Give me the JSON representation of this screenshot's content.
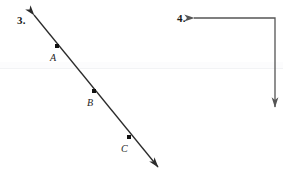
{
  "page": {
    "width": 283,
    "height": 178,
    "background": "#ffffff",
    "ink_color": "#2b2b2b",
    "label_color": "#1a1a1a"
  },
  "problems": [
    {
      "number": "3.",
      "type": "line-with-points",
      "description": "A straight line with arrowheads at both ends, sloping down to the right, with three labeled points on it",
      "line": {
        "x1": 34,
        "y1": 15,
        "x2": 158,
        "y2": 167,
        "arrow_start": true,
        "arrow_end": true,
        "stroke": "#2b2b2b",
        "stroke_width": 1.3
      },
      "points": [
        {
          "label": "A",
          "x": 57,
          "y": 46,
          "dot_size": 4
        },
        {
          "label": "B",
          "x": 94,
          "y": 91,
          "dot_size": 4
        },
        {
          "label": "C",
          "x": 129,
          "y": 137,
          "dot_size": 4
        }
      ]
    },
    {
      "number": "4.",
      "type": "right-angle-path",
      "description": "An L-shaped path: a horizontal segment with a left-pointing arrowhead joined at a right angle to a vertical segment with a downward arrowhead",
      "path": {
        "points": [
          {
            "x": 194,
            "y": 18
          },
          {
            "x": 275,
            "y": 18
          },
          {
            "x": 275,
            "y": 107
          }
        ],
        "arrow_start": true,
        "arrow_end": true,
        "stroke": "#555555",
        "stroke_width": 1.3
      }
    }
  ],
  "artifacts": {
    "scan_band": {
      "top": 62,
      "height": 7,
      "color": "#fcfcfd"
    },
    "scan_line": {
      "top": 68,
      "color": "#f2f3f5"
    }
  }
}
